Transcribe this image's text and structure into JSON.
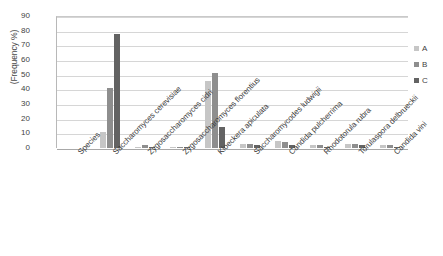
{
  "chart_data": {
    "type": "bar",
    "title": "",
    "xlabel": "",
    "ylabel": "(Frequency %)",
    "ylim": [
      0,
      90
    ],
    "ytick_step": 10,
    "yticks": [
      90,
      80,
      70,
      60,
      50,
      40,
      30,
      20,
      10,
      0
    ],
    "grid": true,
    "legend_position": "right",
    "categories": [
      "Species",
      "Saccharomyces cerevisiae",
      "Zygosaccharomyces cidri",
      "Zygosaccharomyces florentius",
      "Kloeckera apiculata",
      "Saccharomycodes ludwigii",
      "Candida pulcherrima",
      "Rhodotorula rubra",
      "Torulaspora delbrueckii",
      "Candida vini"
    ],
    "series": [
      {
        "name": "A",
        "color": "#c6c6c6",
        "values": [
          0,
          11,
          1,
          1,
          46,
          3,
          5,
          2,
          3,
          2
        ]
      },
      {
        "name": "B",
        "color": "#8e8e8e",
        "values": [
          0,
          41,
          2,
          1,
          51,
          3,
          4,
          2,
          3,
          2
        ]
      },
      {
        "name": "C",
        "color": "#636363",
        "values": [
          0,
          78,
          1,
          1,
          14,
          2,
          2,
          1,
          2,
          1
        ]
      }
    ]
  },
  "legend": {
    "entries": [
      {
        "label": "A"
      },
      {
        "label": "B"
      },
      {
        "label": "C"
      }
    ]
  },
  "axis": {
    "y_title": "(Frequency %)"
  }
}
